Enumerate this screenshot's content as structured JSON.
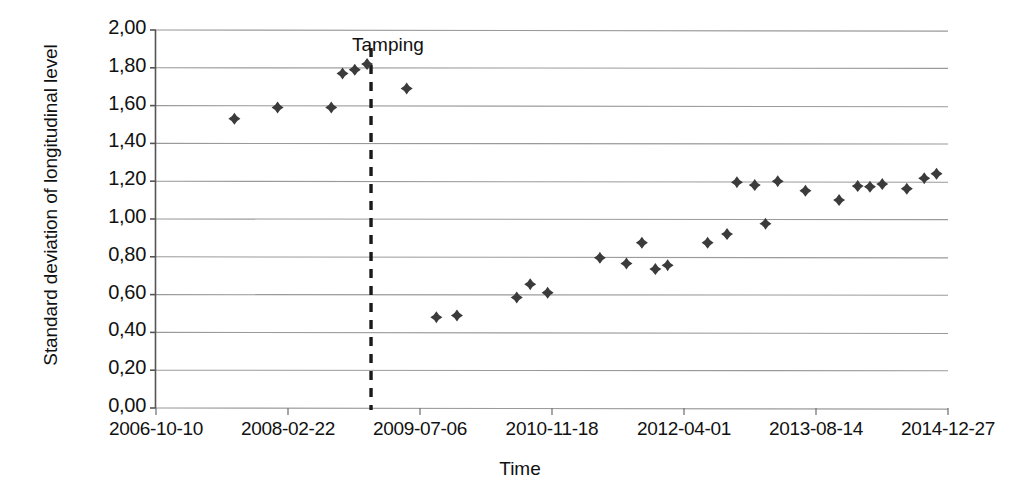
{
  "chart_data": {
    "type": "scatter",
    "title": "",
    "xlabel": "Time",
    "ylabel": "Standard deviation of longitudinal level",
    "ylim": [
      0,
      2
    ],
    "ytick_labels": [
      "0,00",
      "0,20",
      "0,40",
      "0,60",
      "0,80",
      "1,00",
      "1,20",
      "1,40",
      "1,60",
      "1,80",
      "2,00"
    ],
    "ytick_values": [
      0,
      0.2,
      0.4,
      0.6,
      0.8,
      1.0,
      1.2,
      1.4,
      1.6,
      1.8,
      2.0
    ],
    "xtick_labels": [
      "2006-10-10",
      "2008-02-22",
      "2009-07-06",
      "2010-11-18",
      "2012-04-01",
      "2013-08-14",
      "2014-12-27"
    ],
    "grid": "horizontal",
    "legend": "none",
    "marker": "diamond",
    "marker_color": "#3b3b3b",
    "annotations": [
      {
        "label": "Tamping",
        "type": "vertical-dashed-line",
        "x_label": "2009-07-06",
        "x_fraction": 0.2715,
        "line_color": "#1a1a1a"
      }
    ],
    "series": [
      {
        "name": "Standard deviation of longitudinal level",
        "points": [
          {
            "x_fraction": 0.099,
            "y": 1.53
          },
          {
            "x_fraction": 0.1535,
            "y": 1.59
          },
          {
            "x_fraction": 0.2213,
            "y": 1.59
          },
          {
            "x_fraction": 0.2355,
            "y": 1.77
          },
          {
            "x_fraction": 0.251,
            "y": 1.79
          },
          {
            "x_fraction": 0.2665,
            "y": 1.82
          },
          {
            "x_fraction": 0.3165,
            "y": 1.69
          },
          {
            "x_fraction": 0.354,
            "y": 0.48
          },
          {
            "x_fraction": 0.38,
            "y": 0.49
          },
          {
            "x_fraction": 0.4555,
            "y": 0.585
          },
          {
            "x_fraction": 0.4725,
            "y": 0.655
          },
          {
            "x_fraction": 0.4945,
            "y": 0.61
          },
          {
            "x_fraction": 0.5605,
            "y": 0.795
          },
          {
            "x_fraction": 0.594,
            "y": 0.765
          },
          {
            "x_fraction": 0.6135,
            "y": 0.875
          },
          {
            "x_fraction": 0.6305,
            "y": 0.735
          },
          {
            "x_fraction": 0.646,
            "y": 0.755
          },
          {
            "x_fraction": 0.6965,
            "y": 0.875
          },
          {
            "x_fraction": 0.721,
            "y": 0.92
          },
          {
            "x_fraction": 0.7335,
            "y": 1.195
          },
          {
            "x_fraction": 0.756,
            "y": 1.18
          },
          {
            "x_fraction": 0.7695,
            "y": 0.975
          },
          {
            "x_fraction": 0.785,
            "y": 1.2
          },
          {
            "x_fraction": 0.82,
            "y": 1.15
          },
          {
            "x_fraction": 0.8625,
            "y": 1.1
          },
          {
            "x_fraction": 0.886,
            "y": 1.175
          },
          {
            "x_fraction": 0.9015,
            "y": 1.17
          },
          {
            "x_fraction": 0.917,
            "y": 1.185
          },
          {
            "x_fraction": 0.948,
            "y": 1.16
          },
          {
            "x_fraction": 0.97,
            "y": 1.215
          },
          {
            "x_fraction": 0.9855,
            "y": 1.24
          }
        ]
      }
    ]
  },
  "axes": {
    "y_title": "Standard deviation of longitudinal level",
    "x_title": "Time"
  },
  "annotation": {
    "tamping_label": "Tamping"
  }
}
